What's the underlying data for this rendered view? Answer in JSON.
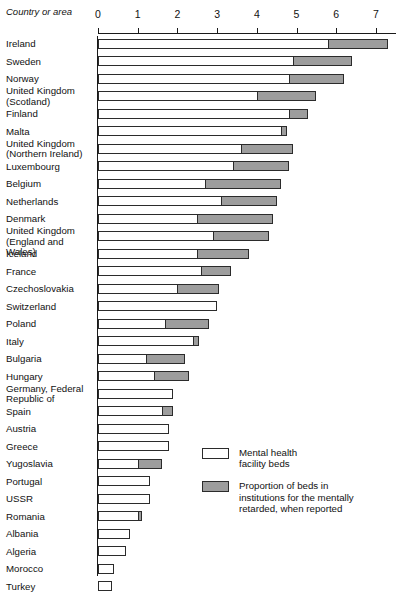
{
  "header": {
    "corner_label": "Country\nor area"
  },
  "legend": {
    "position": "inside-bottom-right",
    "items": [
      {
        "swatch": "white-swatch-icon",
        "label": "Mental health\nfacility beds"
      },
      {
        "swatch": "gray-swatch-icon",
        "label": "Proportion of beds in\ninstitutions for the mentally\nretarded, when reported"
      }
    ]
  },
  "colors": {
    "mental_health_beds": "#ffffff",
    "mentally_retarded_beds": "#9d9d9d",
    "outline": "#2b2b2b",
    "background": "#ffffff"
  },
  "chart_data": {
    "type": "bar",
    "orientation": "horizontal",
    "stacked": true,
    "title": "",
    "subtitle": "",
    "xlabel": "",
    "ylabel": "Country or area",
    "xlim": [
      0,
      7.5
    ],
    "grid": false,
    "legend_position": "inside-bottom-right",
    "tick_labels": [
      "0",
      "1",
      "2",
      "3",
      "4",
      "5",
      "6",
      "7"
    ],
    "ticks": [
      0,
      1,
      2,
      3,
      4,
      5,
      6,
      7
    ],
    "categories": [
      "Ireland",
      "Sweden",
      "Norway",
      "United Kingdom\n(Scotland)",
      "Finland",
      "Malta",
      "United Kingdom\n(Northern Ireland)",
      "Luxembourg",
      "Belgium",
      "Netherlands",
      "Denmark",
      "United Kingdom\n(England and Wales)",
      "Iceland",
      "France",
      "Czechoslovakia",
      "Switzerland",
      "Poland",
      "Italy",
      "Bulgaria",
      "Hungary",
      "Germany, Federal\n  Republic of",
      "Spain",
      "Austria",
      "Greece",
      "Yugoslavia",
      "Portugal",
      "USSR",
      "Romania",
      "Albania",
      "Algeria",
      "Morocco",
      "Turkey"
    ],
    "series": [
      {
        "name": "Mental health facility beds",
        "values": [
          5.8,
          4.9,
          4.8,
          4.0,
          4.8,
          4.6,
          3.6,
          3.4,
          2.7,
          3.1,
          2.5,
          2.9,
          2.5,
          2.6,
          2.0,
          3.0,
          1.7,
          2.4,
          1.2,
          1.4,
          1.9,
          1.6,
          1.8,
          1.8,
          1.0,
          1.3,
          1.3,
          1.0,
          0.8,
          0.7,
          0.4,
          0.35
        ]
      },
      {
        "name": "Proportion of beds in institutions for the mentally retarded, when reported",
        "values": [
          1.5,
          1.5,
          1.4,
          1.5,
          0.5,
          0.15,
          1.3,
          1.4,
          1.9,
          1.4,
          1.9,
          1.4,
          1.3,
          0.75,
          1.05,
          0.0,
          1.1,
          0.15,
          1.0,
          0.9,
          0.0,
          0.3,
          0.0,
          0.0,
          0.6,
          0.0,
          0.0,
          0.1,
          0.0,
          0.0,
          0.0,
          0.0
        ]
      }
    ],
    "totals": [
      7.3,
      6.4,
      6.2,
      5.5,
      5.3,
      4.75,
      4.9,
      4.8,
      4.6,
      4.5,
      4.4,
      4.3,
      3.8,
      3.35,
      3.05,
      3.0,
      2.8,
      2.55,
      2.2,
      2.3,
      1.9,
      1.9,
      1.8,
      1.8,
      1.6,
      1.3,
      1.3,
      1.1,
      0.8,
      0.7,
      0.4,
      0.35
    ]
  }
}
